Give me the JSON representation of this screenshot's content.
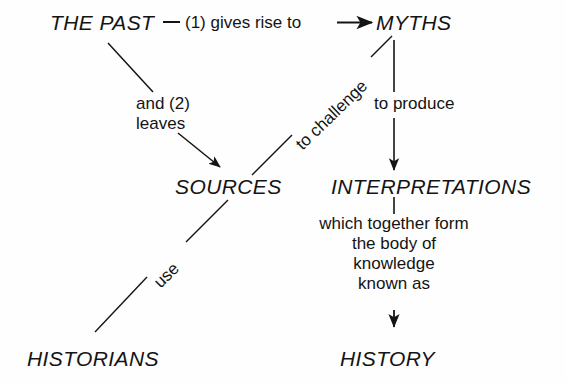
{
  "diagram": {
    "background_color": "#fefefe",
    "ink_color": "#141414",
    "nodes": {
      "the_past": "THE PAST",
      "myths": "MYTHS",
      "sources": "SOURCES",
      "interpretations": "INTERPRETATIONS",
      "historians": "HISTORIANS",
      "history": "HISTORY"
    },
    "edge_labels": {
      "gives_rise_to": "(1) gives rise to",
      "and_leaves_line1": "and (2)",
      "and_leaves_line2": "leaves",
      "to_challenge": "to challenge",
      "to_produce": "to produce",
      "use": "use",
      "which_together_form_line1": "which together form",
      "which_together_form_line2": "the body of",
      "which_together_form_line3": "knowledge",
      "which_together_form_line4": "known as"
    }
  }
}
